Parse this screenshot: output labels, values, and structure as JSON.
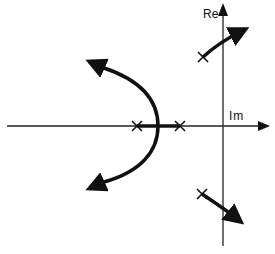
{
  "diagram": {
    "type": "root-locus",
    "axes": {
      "vertical_label": "Re",
      "horizontal_label": "Im"
    },
    "poles": [
      {
        "id": "real-pole-left",
        "position": "on horizontal axis, left"
      },
      {
        "id": "real-pole-right",
        "position": "on horizontal axis, right"
      },
      {
        "id": "complex-pole-upper",
        "position": "upper, left of vertical axis"
      },
      {
        "id": "complex-pole-lower",
        "position": "lower, left of vertical axis"
      }
    ],
    "branches": [
      {
        "id": "breakaway-upper",
        "direction": "from breakaway point toward upper-left"
      },
      {
        "id": "breakaway-lower",
        "direction": "from breakaway point toward lower-left"
      },
      {
        "id": "upper-complex",
        "direction": "from upper pole toward upper-right"
      },
      {
        "id": "lower-complex",
        "direction": "from lower pole toward lower-right"
      }
    ],
    "colors": {
      "ink": "#111111",
      "background": "#ffffff"
    }
  }
}
